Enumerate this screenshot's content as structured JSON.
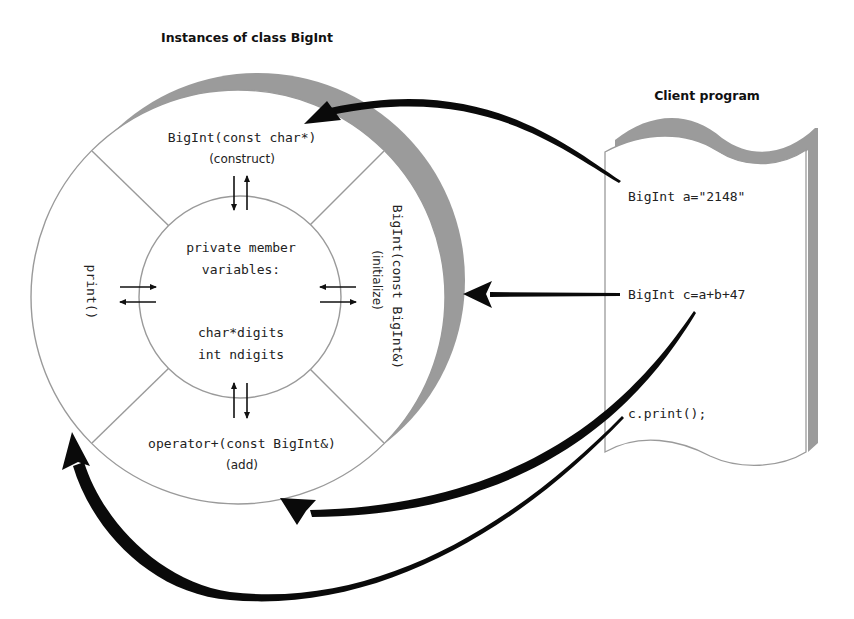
{
  "class_diagram": {
    "title": "Instances of class BigInt",
    "center": {
      "heading": "private member",
      "heading2": "variables:",
      "members": [
        "char*digits",
        "int ndigits"
      ]
    },
    "methods": {
      "top": {
        "signature": "BigInt(const char*)",
        "purpose": "(construct)"
      },
      "right": {
        "signature": "BigInt(const BigInt&)",
        "purpose": "(initialize)"
      },
      "bottom": {
        "signature": "operator+(const BigInt&)",
        "purpose": "(add)"
      },
      "left": {
        "signature": "print()"
      }
    }
  },
  "client_program": {
    "title": "Client program",
    "lines": [
      "BigInt a=\"2148\"",
      "BigInt c=a+b+47",
      "c.print();"
    ]
  },
  "colors": {
    "shadow": "#9b9b9b",
    "outline": "#9a9a9a",
    "arrow": "#0a0a0a"
  }
}
